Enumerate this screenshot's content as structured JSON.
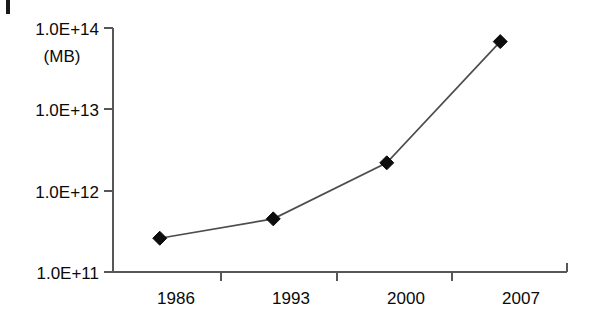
{
  "chart_data": {
    "type": "line",
    "title": "",
    "subtitle": "",
    "xlabel": "",
    "ylabel": "(MB)",
    "unit_label": "(MB)",
    "x": [
      "1986",
      "1993",
      "2000",
      "2007"
    ],
    "categories": [
      "1986",
      "1993",
      "2000",
      "2007"
    ],
    "values": [
      260000000000.0,
      450000000000.0,
      2200000000000.0,
      68000000000000.0
    ],
    "series": [
      {
        "name": "",
        "values": [
          260000000000.0,
          450000000000.0,
          2200000000000.0,
          68000000000000.0
        ],
        "marker": "diamond",
        "color": "#0d0d0d"
      }
    ],
    "y_scale": "log",
    "ylim": [
      100000000000.0,
      100000000000000.0
    ],
    "y_ticks": [
      100000000000.0,
      1000000000000.0,
      10000000000000.0,
      100000000000000.0
    ],
    "y_tick_labels": [
      "1.0E+11",
      "1.0E+12",
      "1.0E+13",
      "1.0E+14"
    ],
    "x_tick_labels": [
      "1986",
      "1993",
      "2000",
      "2007"
    ],
    "grid": false,
    "legend": false,
    "legend_position": "none"
  },
  "axis": {
    "y_labels": [
      {
        "text": "1.0E+14"
      },
      {
        "text": "1.0E+13"
      },
      {
        "text": "1.0E+12"
      },
      {
        "text": "1.0E+11"
      }
    ],
    "unit": "(MB)",
    "x_labels": [
      {
        "text": "1986"
      },
      {
        "text": "1993"
      },
      {
        "text": "2000"
      },
      {
        "text": "2007"
      }
    ]
  },
  "colors": {
    "line": "#4d4d4d",
    "marker": "#0d0d0d",
    "axis": "#575757",
    "text": "#0a0a0a",
    "background": "#ffffff"
  }
}
